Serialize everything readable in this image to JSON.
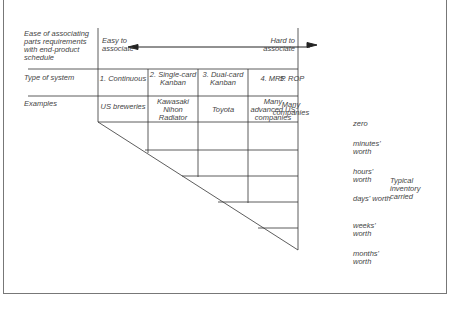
{
  "row_labels": {
    "ease": "Ease of associating parts requirements with end-product schedule",
    "type": "Type of system",
    "examples": "Examples"
  },
  "ease_scale": {
    "left": "Easy to associate",
    "right": "Hard to associate"
  },
  "systems": [
    {
      "type": "1. Continuous",
      "example": "US breweries"
    },
    {
      "type": "2. Single-card Kanban",
      "example": "Kawasaki Nihon Radiator"
    },
    {
      "type": "3. Dual-card Kanban",
      "example": "Toyota"
    },
    {
      "type": "4. MRP",
      "example": "Many advanced US companies"
    },
    {
      "type": "5. ROP",
      "example": "Many companies"
    }
  ],
  "inventory_levels": [
    "zero",
    "minutes' worth",
    "hours' worth",
    "days' worth",
    "weeks' worth",
    "months' worth"
  ],
  "inventory_axis_label": "Typical inventory carried",
  "colors": {
    "line": "#333333",
    "text": "#444444",
    "frame": "#777777"
  }
}
